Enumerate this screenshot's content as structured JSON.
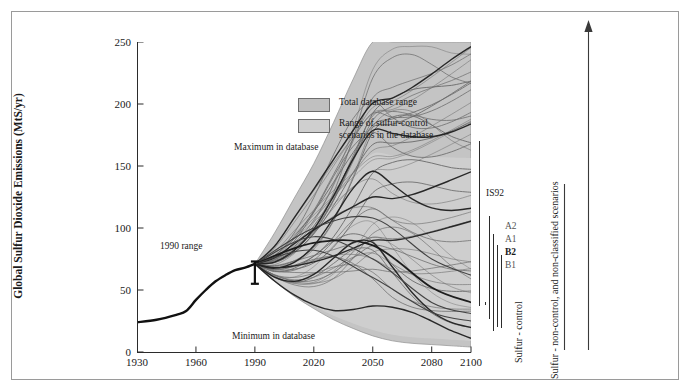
{
  "chart_data": {
    "type": "line",
    "title": "",
    "xlabel": "",
    "ylabel": "Global Sulfur Dioxide Emissions (MtS/yr)",
    "xlim": [
      1930,
      2100
    ],
    "ylim": [
      0,
      250
    ],
    "xticks": [
      1930,
      1960,
      1990,
      2020,
      2050,
      2080,
      2100
    ],
    "yticks": [
      0,
      50,
      100,
      150,
      200,
      250
    ],
    "grid": false,
    "legend_position": "top-left",
    "legend": [
      {
        "key": "total-database-range",
        "label": "Total database range",
        "color": "#c0c0c0"
      },
      {
        "key": "sulfur-control-range",
        "label": "Range of sulfur-control\nscenarios in the database",
        "color": "#cfcfcf"
      }
    ],
    "annotations": [
      {
        "key": "maximum-in-database",
        "text": "Maximum in database",
        "x": 2008,
        "y": 170
      },
      {
        "key": "minimum-in-database",
        "text": "Minimum in database",
        "x": 2008,
        "y": 10
      },
      {
        "key": "1990-range",
        "text": "1990 range",
        "x": 1970,
        "y": 90
      },
      {
        "key": "is92",
        "text": "IS92",
        "x": 2103,
        "y": 128
      }
    ],
    "series": [
      {
        "name": "historical",
        "style": "thick-black",
        "x": [
          1930,
          1940,
          1950,
          1955,
          1960,
          1965,
          1970,
          1975,
          1980,
          1985,
          1990
        ],
        "values": [
          24,
          26,
          30,
          33,
          42,
          50,
          57,
          62,
          66,
          68,
          71
        ]
      },
      {
        "name": "total-database-range-upper",
        "style": "band-upper",
        "x": [
          1990,
          2000,
          2010,
          2020,
          2030,
          2040,
          2050,
          2060,
          2070,
          2080,
          2090,
          2100
        ],
        "values": [
          71,
          96,
          124,
          152,
          185,
          220,
          250,
          250,
          250,
          250,
          250,
          250
        ]
      },
      {
        "name": "total-database-range-lower",
        "style": "band-lower",
        "x": [
          1990,
          2000,
          2010,
          2020,
          2030,
          2040,
          2050,
          2060,
          2070,
          2080,
          2090,
          2100
        ],
        "values": [
          71,
          57,
          45,
          35,
          26,
          19,
          13,
          9,
          7,
          6,
          5,
          4
        ]
      },
      {
        "name": "marker-scenario-a2",
        "style": "thin-grey",
        "x": [
          1990,
          2020,
          2050,
          2080,
          2100
        ],
        "values": [
          71,
          100,
          108,
          75,
          62
        ]
      },
      {
        "name": "marker-scenario-a1",
        "style": "thin-grey",
        "x": [
          1990,
          2020,
          2050,
          2080,
          2100
        ],
        "values": [
          71,
          93,
          75,
          40,
          31
        ]
      },
      {
        "name": "marker-scenario-b2",
        "style": "thick-grey",
        "x": [
          1990,
          2020,
          2050,
          2080,
          2100
        ],
        "values": [
          71,
          88,
          86,
          52,
          40
        ]
      },
      {
        "name": "marker-scenario-b1",
        "style": "thin-grey",
        "x": [
          1990,
          2020,
          2050,
          2080,
          2100
        ],
        "values": [
          71,
          82,
          60,
          32,
          25
        ]
      }
    ],
    "range_bars_2100": [
      {
        "key": "is92",
        "label": "IS92",
        "low": 37,
        "high": 170
      },
      {
        "key": "a2",
        "label": "A2",
        "low": 27,
        "high": 110
      },
      {
        "key": "a1",
        "label": "A1",
        "low": 17,
        "high": 95
      },
      {
        "key": "b2",
        "label": "B2",
        "low": 20,
        "high": 86
      },
      {
        "key": "b1",
        "label": "B1",
        "low": 19,
        "high": 78
      },
      {
        "key": "tick",
        "label": "",
        "low": 38,
        "high": 40
      }
    ],
    "error_bar_1990": {
      "key": "1990-range",
      "x": 1990,
      "low": 55,
      "high": 73,
      "mid": 71
    }
  },
  "side_captions": {
    "control": "Sulfur - control",
    "noncontrol": "Sulfur - non-control, and non-classified scenarios"
  },
  "colors": {
    "band_total": "#c0c0c0",
    "band_control": "#cfcfcf",
    "line_dark": "#1a1a1a",
    "line_grey": "#555555",
    "axis": "#2b2b2b",
    "frame": "#9a9a9a"
  }
}
